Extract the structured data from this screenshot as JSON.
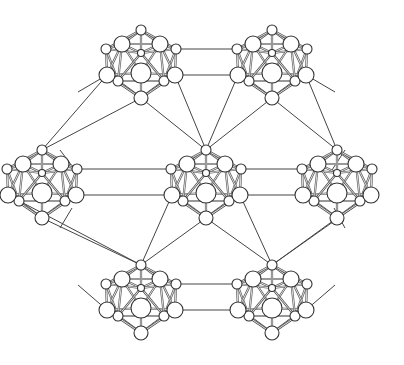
{
  "diagram": {
    "title": "",
    "colors": {
      "background": "#ffffff",
      "bond": "#444444",
      "atom_fill": "#ffffff",
      "atom_stroke": "#333333"
    },
    "clusters": [
      {
        "id": "top-left",
        "cx": 141,
        "cy": 68
      },
      {
        "id": "top-right",
        "cx": 272,
        "cy": 68
      },
      {
        "id": "mid-left",
        "cx": 42,
        "cy": 188
      },
      {
        "id": "center",
        "cx": 206,
        "cy": 188
      },
      {
        "id": "mid-right",
        "cx": 337,
        "cy": 188
      },
      {
        "id": "bottom-left",
        "cx": 141,
        "cy": 303
      },
      {
        "id": "bottom-right",
        "cx": 272,
        "cy": 303
      }
    ]
  }
}
